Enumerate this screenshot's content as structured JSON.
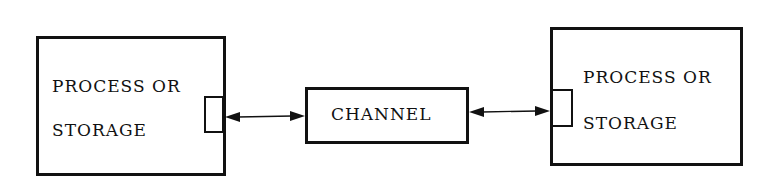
{
  "diagram": {
    "left_node": {
      "line1": "PROCESS OR",
      "line2": "STORAGE"
    },
    "channel": {
      "label": "CHANNEL"
    },
    "right_node": {
      "line1": "PROCESS OR",
      "line2": "STORAGE"
    },
    "connections": [
      {
        "from": "left_node",
        "to": "channel",
        "type": "bidirectional-arrow"
      },
      {
        "from": "channel",
        "to": "right_node",
        "type": "bidirectional-arrow"
      }
    ]
  }
}
